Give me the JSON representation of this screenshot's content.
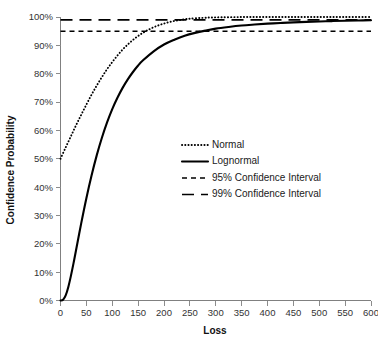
{
  "chart_data": {
    "type": "line",
    "title": "",
    "xlabel": "Loss",
    "ylabel": "Confidence Probability",
    "xlim": [
      0,
      600
    ],
    "ylim": [
      0,
      1.0
    ],
    "grid": false,
    "legend_position": "center-right",
    "x_ticks": [
      0,
      50,
      100,
      150,
      200,
      250,
      300,
      350,
      400,
      450,
      500,
      550,
      600
    ],
    "x_tick_labels": [
      "0",
      "50",
      "100",
      "150",
      "200",
      "250",
      "300",
      "350",
      "400",
      "450",
      "500",
      "550",
      "600"
    ],
    "y_ticks": [
      0,
      0.1,
      0.2,
      0.3,
      0.4,
      0.5,
      0.6,
      0.7,
      0.8,
      0.9,
      1.0
    ],
    "y_tick_labels": [
      "0%",
      "10%",
      "20%",
      "30%",
      "40%",
      "50%",
      "60%",
      "70%",
      "80%",
      "90%",
      "100%"
    ],
    "series": [
      {
        "name": "Normal",
        "style": "dotted",
        "color": "#000000",
        "x": [
          0,
          10,
          20,
          30,
          40,
          50,
          60,
          70,
          80,
          90,
          100,
          110,
          120,
          130,
          140,
          150,
          160,
          170,
          180,
          190,
          200,
          210,
          220,
          230,
          240,
          250,
          275,
          300,
          350,
          400,
          450,
          500,
          550,
          600
        ],
        "values": [
          0.5,
          0.54,
          0.579,
          0.618,
          0.655,
          0.691,
          0.726,
          0.758,
          0.788,
          0.816,
          0.841,
          0.864,
          0.885,
          0.903,
          0.919,
          0.933,
          0.945,
          0.955,
          0.964,
          0.971,
          0.977,
          0.982,
          0.986,
          0.989,
          0.992,
          0.994,
          0.997,
          0.9987,
          0.9998,
          1.0,
          1.0,
          1.0,
          1.0,
          1.0
        ]
      },
      {
        "name": "Lognormal",
        "style": "solid",
        "color": "#000000",
        "x": [
          0,
          5,
          10,
          15,
          20,
          25,
          30,
          40,
          50,
          60,
          70,
          80,
          90,
          100,
          110,
          120,
          130,
          140,
          150,
          160,
          180,
          200,
          220,
          240,
          260,
          280,
          300,
          325,
          350,
          375,
          400,
          425,
          450,
          475,
          500,
          525,
          550,
          575,
          600
        ],
        "values": [
          0.0,
          0.003,
          0.018,
          0.047,
          0.086,
          0.13,
          0.177,
          0.272,
          0.361,
          0.441,
          0.512,
          0.574,
          0.628,
          0.675,
          0.715,
          0.75,
          0.78,
          0.806,
          0.829,
          0.848,
          0.879,
          0.903,
          0.92,
          0.934,
          0.944,
          0.952,
          0.959,
          0.965,
          0.97,
          0.9735,
          0.9765,
          0.979,
          0.981,
          0.9828,
          0.9843,
          0.9856,
          0.9867,
          0.9877,
          0.9885
        ]
      },
      {
        "name": "95% Confidence Interval",
        "style": "dashed-short",
        "color": "#000000",
        "constant_y": 0.95
      },
      {
        "name": "99% Confidence Interval",
        "style": "dashed-long",
        "color": "#000000",
        "constant_y": 0.99
      }
    ],
    "legend": [
      {
        "label": "Normal",
        "style": "dotted"
      },
      {
        "label": "Lognormal",
        "style": "solid"
      },
      {
        "label": "95% Confidence Interval",
        "style": "dashed-short"
      },
      {
        "label": "99% Confidence Interval",
        "style": "dashed-long"
      }
    ]
  }
}
